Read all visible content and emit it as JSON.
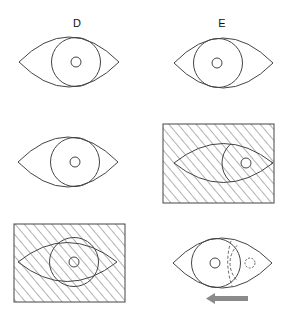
{
  "columns": [
    {
      "id": "D",
      "label": "D"
    },
    {
      "id": "E",
      "label": "E"
    }
  ],
  "colors": {
    "stroke": "#444444",
    "hatch": "#555555",
    "arrow": "#8a8a8a",
    "background": "#ffffff"
  },
  "panels": [
    {
      "name": "D-row1",
      "type": "eye",
      "hatched": false,
      "pupil": "centered"
    },
    {
      "name": "E-row1",
      "type": "eye",
      "hatched": false,
      "pupil": "centered"
    },
    {
      "name": "D-row2",
      "type": "eye",
      "hatched": false,
      "pupil": "centered"
    },
    {
      "name": "E-row2",
      "type": "eye",
      "hatched": true,
      "pupil": "shifted-right"
    },
    {
      "name": "D-row3",
      "type": "eye",
      "hatched": true,
      "pupil": "centered"
    },
    {
      "name": "E-row3",
      "type": "eye",
      "hatched": false,
      "pupil": "centered",
      "ghost_iris": "dashed-right",
      "arrow": "left"
    }
  ]
}
